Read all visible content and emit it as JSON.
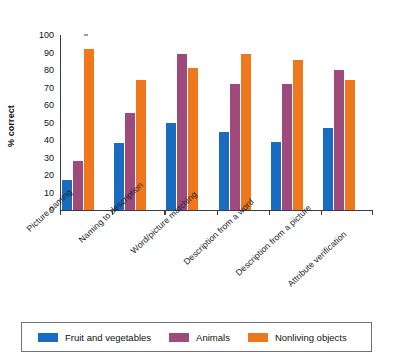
{
  "chart_data": {
    "type": "bar",
    "title": "",
    "xlabel": "",
    "ylabel": "% correct",
    "ylim": [
      0,
      100
    ],
    "ytick_step": 10,
    "yticks": [
      100,
      90,
      80,
      70,
      60,
      50,
      40,
      30,
      20,
      10,
      0
    ],
    "grid": false,
    "legend_position": "bottom",
    "categories": [
      "Picture naming",
      "Naming to description",
      "Word/picture matching",
      "Description from a word",
      "Description from a picture",
      "Attribute verification"
    ],
    "series": [
      {
        "name": "Fruit and vegetables",
        "color": "#1a6cc0",
        "values": [
          17,
          38.5,
          50,
          44.5,
          39,
          47
        ]
      },
      {
        "name": "Animals",
        "color": "#9e4a7c",
        "values": [
          28,
          55.5,
          89,
          72,
          72,
          80
        ]
      },
      {
        "name": "Nonliving objects",
        "color": "#f0781c",
        "values": [
          92,
          74.5,
          81,
          89,
          85.5,
          74.5
        ]
      }
    ]
  },
  "legend": {
    "items": [
      {
        "label": "Fruit and vegetables",
        "color": "#1a6cc0"
      },
      {
        "label": "Animals",
        "color": "#9e4a7c"
      },
      {
        "label": "Nonliving objects",
        "color": "#f0781c"
      }
    ]
  }
}
